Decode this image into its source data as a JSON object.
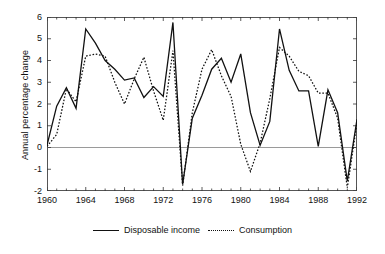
{
  "chart_data": {
    "type": "line",
    "title": "",
    "xlabel": "",
    "ylabel": "Annual percentage change",
    "xlim": [
      1960,
      1992
    ],
    "ylim": [
      -2,
      6
    ],
    "yticks": [
      6,
      5,
      4,
      3,
      2,
      1,
      0,
      -1,
      -2
    ],
    "xticks": [
      1960,
      1964,
      1968,
      1972,
      1976,
      1980,
      1984,
      1988,
      1992
    ],
    "xtick_interval_minor": 1,
    "grid": false,
    "zero_line": true,
    "legend_position": "bottom",
    "x": [
      1960,
      1961,
      1962,
      1963,
      1964,
      1965,
      1966,
      1967,
      1968,
      1969,
      1970,
      1971,
      1972,
      1973,
      1974,
      1975,
      1976,
      1977,
      1978,
      1979,
      1980,
      1981,
      1982,
      1983,
      1984,
      1985,
      1986,
      1987,
      1988,
      1989,
      1990,
      1991,
      1992
    ],
    "series": [
      {
        "name": "Disposable income",
        "style": "solid",
        "color": "#111111",
        "values": [
          0.1,
          1.9,
          2.75,
          1.8,
          5.45,
          4.8,
          4.0,
          3.6,
          3.1,
          3.2,
          2.3,
          2.8,
          2.35,
          5.75,
          -1.7,
          1.35,
          2.4,
          3.6,
          4.1,
          3.0,
          4.3,
          1.6,
          0.1,
          1.2,
          5.45,
          3.55,
          2.6,
          2.6,
          0.05,
          2.65,
          1.6,
          -1.55,
          1.3
        ]
      },
      {
        "name": "Consumption",
        "style": "dotted",
        "color": "#111111",
        "values": [
          0.05,
          0.6,
          2.7,
          2.1,
          4.2,
          4.3,
          4.2,
          3.0,
          2.0,
          3.15,
          4.15,
          2.6,
          1.25,
          4.45,
          -1.75,
          1.6,
          3.6,
          4.5,
          3.3,
          2.35,
          0.15,
          -1.1,
          0.2,
          2.25,
          4.6,
          4.2,
          3.5,
          3.3,
          2.5,
          2.5,
          1.35,
          -1.85,
          1.15
        ]
      }
    ]
  },
  "legend": {
    "items": [
      {
        "label": "Disposable income",
        "style": "solid"
      },
      {
        "label": "Consumption",
        "style": "dotted"
      }
    ]
  }
}
